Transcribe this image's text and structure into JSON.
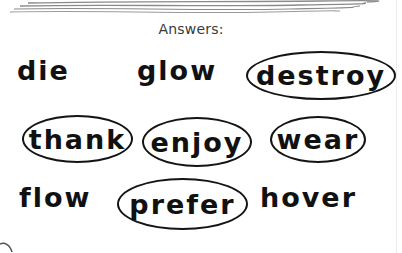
{
  "heading": "Answers:",
  "words": {
    "die": "die",
    "glow": "glow",
    "destroy": "destroy",
    "thank": "thank",
    "enjoy": "enjoy",
    "wear": "wear",
    "flow": "flow",
    "prefer": "prefer",
    "hover": "hover"
  },
  "rows": [
    {
      "items": [
        {
          "word": "die",
          "circled": false
        },
        {
          "word": "glow",
          "circled": false
        },
        {
          "word": "destroy",
          "circled": true
        }
      ]
    },
    {
      "items": [
        {
          "word": "thank",
          "circled": true
        },
        {
          "word": "enjoy",
          "circled": true
        },
        {
          "word": "wear",
          "circled": true
        }
      ]
    },
    {
      "items": [
        {
          "word": "flow",
          "circled": false
        },
        {
          "word": "prefer",
          "circled": true
        },
        {
          "word": "hover",
          "circled": false
        }
      ]
    }
  ],
  "colors": {
    "ink": "#111111",
    "heading": "#3a3a3a",
    "deco_lines": "#8a8a8a",
    "background": "#ffffff"
  }
}
